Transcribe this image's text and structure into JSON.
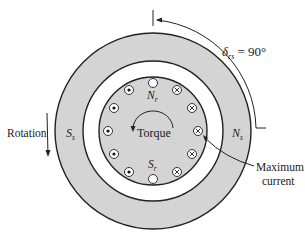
{
  "diagram": {
    "labels": {
      "delta_symbol": "δ",
      "delta_sub": "rs",
      "delta_value": " = 90°",
      "rotation": "Rotation",
      "torque": "Torque",
      "stator_south": "S",
      "stator_south_sub": "s",
      "stator_north": "N",
      "stator_north_sub": "s",
      "rotor_north": "N",
      "rotor_north_sub": "r",
      "rotor_south": "S",
      "rotor_south_sub": "r",
      "max_current_line1": "Maximum",
      "max_current_line2": "current"
    },
    "colors": {
      "stator_fill": "#d4d4d4",
      "rotor_fill": "#d4d4d4",
      "gap_fill": "#ffffff",
      "stroke": "#222222"
    },
    "conductors": {
      "left_dot": 5,
      "right_cross": 5,
      "top_empty": 1,
      "bottom_empty": 1
    }
  }
}
